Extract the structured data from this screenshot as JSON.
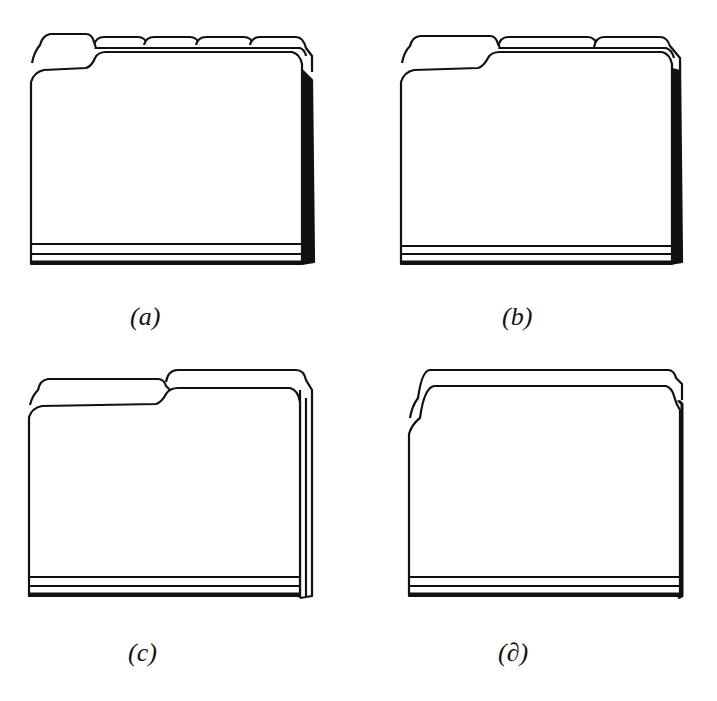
{
  "figure": {
    "panels": [
      {
        "id": "a",
        "label": "(a)",
        "tab_cut": "fifth-cut",
        "tab_count": 5
      },
      {
        "id": "b",
        "label": "(b)",
        "tab_cut": "third-cut",
        "tab_count": 3
      },
      {
        "id": "c",
        "label": "(c)",
        "tab_cut": "half-cut",
        "tab_count": 2
      },
      {
        "id": "d",
        "label": "(∂)",
        "tab_cut": "straight-cut",
        "tab_count": 1
      }
    ],
    "colors": {
      "ink": "#111111",
      "paper": "#ffffff"
    }
  }
}
